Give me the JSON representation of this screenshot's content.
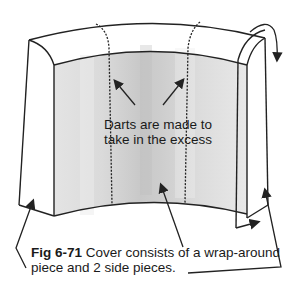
{
  "figure": {
    "center_annotation": {
      "line1": "Darts are made to",
      "line2": "take in the excess"
    },
    "caption": {
      "figure_number": "Fig 6-71",
      "text_line1": " Cover consists of a wrap-around",
      "text_line2": "piece and 2 side pieces."
    },
    "colors": {
      "outline": "#222222",
      "shade_light": "#e6e6e6",
      "shade_mid": "#d2d2d2",
      "shade_dark": "#c0c0c0",
      "background": "#ffffff"
    },
    "elements": [
      "wrap-around-piece",
      "left-side-piece",
      "right-side-piece",
      "left-dart-line",
      "right-dart-line",
      "wrap-around-arrow"
    ]
  }
}
